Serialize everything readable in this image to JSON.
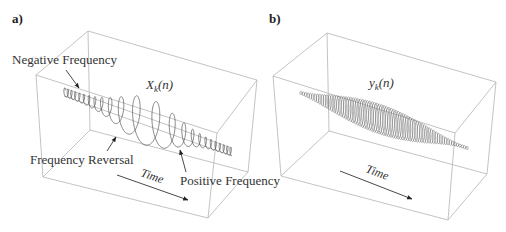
{
  "panels": [
    {
      "id": "a",
      "label": "a)",
      "signal": {
        "symbol": "X",
        "subscript": "k",
        "arg": "(n)"
      },
      "annotations": {
        "negative_frequency": "Negative Frequency",
        "frequency_reversal": "Frequency Reversal",
        "positive_frequency": "Positive Frequency"
      },
      "time_label": "Time"
    },
    {
      "id": "b",
      "label": "b)",
      "signal": {
        "symbol": "y",
        "subscript": "k",
        "arg": "(n)"
      },
      "time_label": "Time"
    }
  ]
}
